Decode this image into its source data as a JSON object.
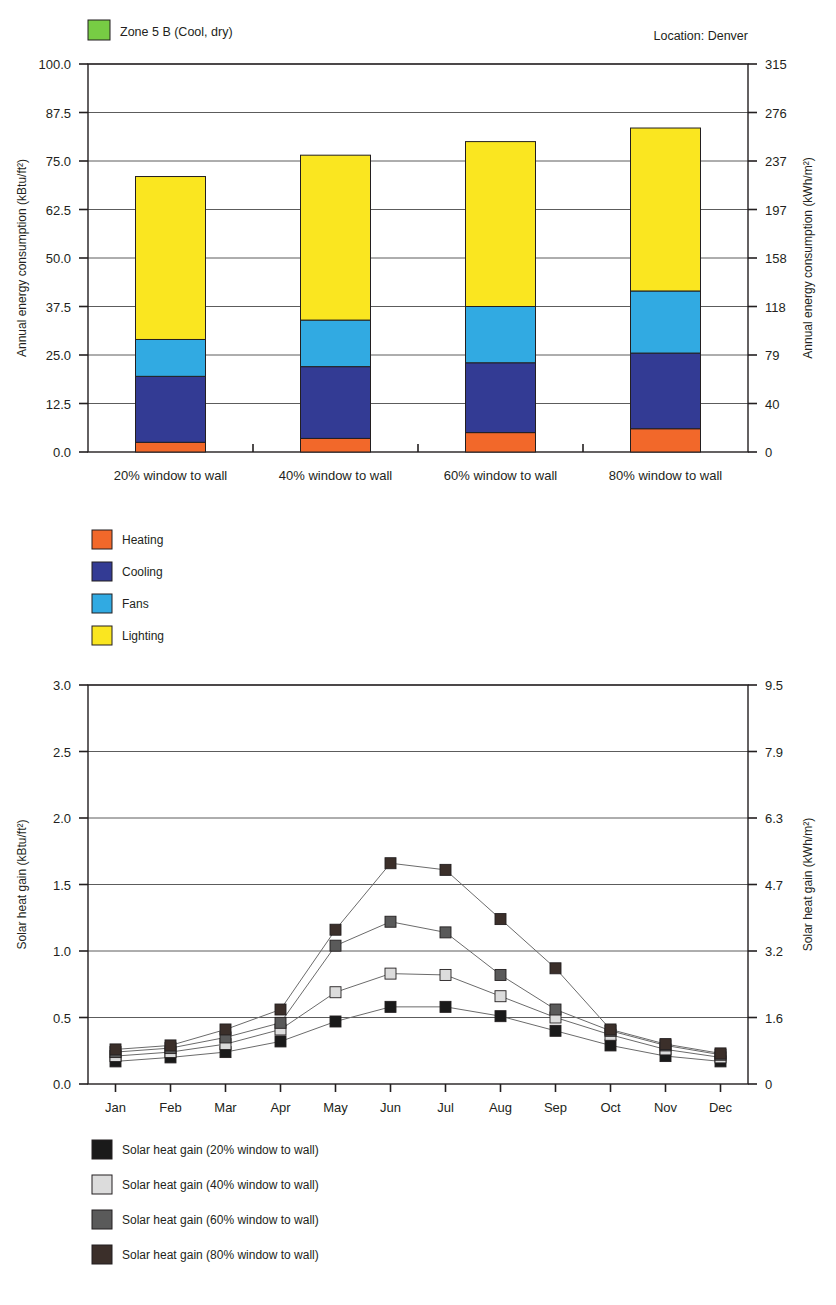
{
  "header": {
    "zone_label": "Zone 5 B (Cool, dry)",
    "zone_swatch_color": "#77CC44",
    "location_label": "Location:  Denver"
  },
  "chart_data": [
    {
      "type": "bar",
      "id": "annual-energy-consumption",
      "stacked": true,
      "title": "",
      "xlabel": "",
      "ylabel": "Annual energy consumption (kBtu/ft²)",
      "ylabel_right": "Annual energy consumption (kWh/m²)",
      "categories": [
        "20% window to wall",
        "40% window to wall",
        "60% window to wall",
        "80% window to wall"
      ],
      "ylim": [
        0,
        100
      ],
      "yticks": [
        "0.0",
        "12.5",
        "25.0",
        "37.5",
        "50.0",
        "62.5",
        "75.0",
        "87.5",
        "100.0"
      ],
      "ytick_values": [
        0,
        12.5,
        25,
        37.5,
        50,
        62.5,
        75,
        87.5,
        100
      ],
      "yticks_right": [
        "0",
        "40",
        "79",
        "118",
        "158",
        "197",
        "237",
        "276",
        "315"
      ],
      "grid": true,
      "legend_position": "below-left",
      "series": [
        {
          "name": "Heating",
          "color": "#F2682A",
          "values": [
            2.5,
            3.5,
            5.0,
            6.0
          ]
        },
        {
          "name": "Cooling",
          "color": "#333B94",
          "values": [
            17.0,
            18.5,
            18.0,
            19.5
          ]
        },
        {
          "name": "Fans",
          "color": "#31AAE2",
          "values": [
            9.5,
            12.0,
            14.5,
            16.0
          ]
        },
        {
          "name": "Lighting",
          "color": "#FAE620",
          "values": [
            42.0,
            42.5,
            42.5,
            42.0
          ]
        }
      ],
      "totals": [
        71.0,
        76.5,
        80.0,
        83.5
      ]
    },
    {
      "type": "line",
      "id": "solar-heat-gain",
      "title": "",
      "xlabel": "",
      "ylabel": "Solar heat gain (kBtu/ft²)",
      "ylabel_right": "Solar heat gain (kWh/m²)",
      "x": [
        "Jan",
        "Feb",
        "Mar",
        "Apr",
        "May",
        "Jun",
        "Jul",
        "Aug",
        "Sep",
        "Oct",
        "Nov",
        "Dec"
      ],
      "ylim": [
        0,
        3.0
      ],
      "yticks": [
        "0.0",
        "0.5",
        "1.0",
        "1.5",
        "2.0",
        "2.5",
        "3.0"
      ],
      "ytick_values": [
        0,
        0.5,
        1.0,
        1.5,
        2.0,
        2.5,
        3.0
      ],
      "yticks_right": [
        "0",
        "1.6",
        "3.2",
        "4.7",
        "6.3",
        "7.9",
        "9.5"
      ],
      "grid": true,
      "legend_position": "below-left",
      "series": [
        {
          "name": "Solar heat gain (20% window to wall)",
          "color": "#1A1A1A",
          "values": [
            0.17,
            0.2,
            0.24,
            0.32,
            0.47,
            0.58,
            0.58,
            0.51,
            0.4,
            0.29,
            0.21,
            0.17
          ]
        },
        {
          "name": "Solar heat gain (40% window to wall)",
          "color": "#DCDCDC",
          "values": [
            0.21,
            0.24,
            0.3,
            0.41,
            0.69,
            0.83,
            0.82,
            0.66,
            0.5,
            0.37,
            0.26,
            0.2
          ]
        },
        {
          "name": "Solar heat gain (60% window to wall)",
          "color": "#5A5A5A",
          "values": [
            0.24,
            0.27,
            0.35,
            0.46,
            1.04,
            1.22,
            1.14,
            0.82,
            0.56,
            0.4,
            0.29,
            0.22
          ]
        },
        {
          "name": "Solar heat gain (80% window to wall)",
          "color": "#3B2F2A",
          "values": [
            0.26,
            0.29,
            0.41,
            0.56,
            1.16,
            1.66,
            1.61,
            1.24,
            0.87,
            0.41,
            0.3,
            0.23
          ]
        }
      ]
    }
  ]
}
